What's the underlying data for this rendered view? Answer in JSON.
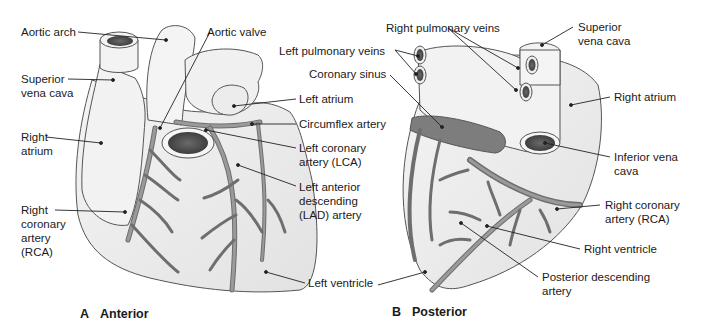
{
  "colors": {
    "heart_fill": "#eeeeee",
    "heart_stroke": "#555555",
    "vessel_fill": "#8f8f8f",
    "vessel_stroke": "#5a5a5a",
    "sinus_fill": "#7a7a7a",
    "opening_dark": "#4a4a4a",
    "leader_line": "#222222",
    "text": "#1a1a1a"
  },
  "panels": [
    {
      "id": "A",
      "letter": "A",
      "title": "Anterior",
      "labels": [
        {
          "id": "aortic-arch",
          "text": "Aortic arch"
        },
        {
          "id": "aortic-valve",
          "text": "Aortic valve"
        },
        {
          "id": "superior-vena-cava",
          "text": "Superior\nvena cava"
        },
        {
          "id": "left-atrium",
          "text": "Left atrium"
        },
        {
          "id": "circumflex-artery",
          "text": "Circumflex artery"
        },
        {
          "id": "right-atrium",
          "text": "Right\natrium"
        },
        {
          "id": "left-coronary-artery",
          "text": "Left coronary\nartery (LCA)"
        },
        {
          "id": "left-anterior-descending",
          "text": "Left anterior\ndescending\n(LAD) artery"
        },
        {
          "id": "right-coronary-artery",
          "text": "Right\ncoronary\nartery\n(RCA)"
        },
        {
          "id": "left-ventricle",
          "text": "Left ventricle"
        }
      ]
    },
    {
      "id": "B",
      "letter": "B",
      "title": "Posterior",
      "labels": [
        {
          "id": "right-pulmonary-veins",
          "text": "Right pulmonary veins"
        },
        {
          "id": "left-pulmonary-veins",
          "text": "Left pulmonary veins"
        },
        {
          "id": "coronary-sinus",
          "text": "Coronary sinus"
        },
        {
          "id": "superior-vena-cava",
          "text": "Superior\nvena cava"
        },
        {
          "id": "right-atrium",
          "text": "Right atrium"
        },
        {
          "id": "inferior-vena-cava",
          "text": "Inferior vena\ncava"
        },
        {
          "id": "right-coronary-artery",
          "text": "Right coronary\nartery (RCA)"
        },
        {
          "id": "right-ventricle",
          "text": "Right ventricle"
        },
        {
          "id": "posterior-descending-artery",
          "text": "Posterior descending\nartery"
        }
      ]
    }
  ]
}
